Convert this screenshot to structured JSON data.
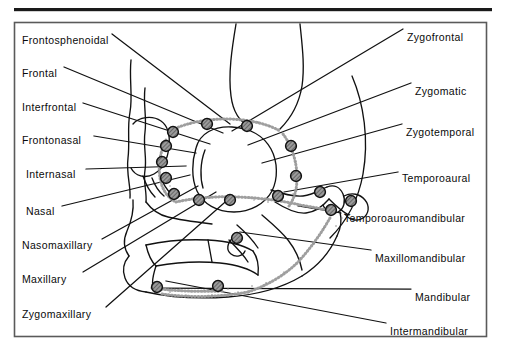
{
  "figure": {
    "type": "anatomical-diagram",
    "frame": {
      "border_color": "#555555",
      "background": "#ffffff"
    },
    "top_rule": {
      "color": "#1a1a1a"
    },
    "ink_color": "#111111",
    "suture_marker": {
      "shape": "circle",
      "fill": "#8c8c8c",
      "stroke": "#111111",
      "pattern": "hatched"
    },
    "labels_left": [
      {
        "id": "frontosphenoidal",
        "text": "Frontosphenoidal",
        "x": 22,
        "y": 34
      },
      {
        "id": "frontal",
        "text": "Frontal",
        "x": 22,
        "y": 67
      },
      {
        "id": "interfrontal",
        "text": "Interfrontal",
        "x": 22,
        "y": 101
      },
      {
        "id": "frontonasal",
        "text": "Frontonasal",
        "x": 22,
        "y": 134
      },
      {
        "id": "internasal",
        "text": "Internasal",
        "x": 26,
        "y": 168
      },
      {
        "id": "nasal",
        "text": "Nasal",
        "x": 26,
        "y": 205
      },
      {
        "id": "nasomaxillary",
        "text": "Nasomaxillary",
        "x": 22,
        "y": 239
      },
      {
        "id": "maxillary",
        "text": "Maxillary",
        "x": 22,
        "y": 273
      },
      {
        "id": "zygomaxillary",
        "text": "Zygomaxillary",
        "x": 22,
        "y": 308
      }
    ],
    "labels_right": [
      {
        "id": "zygofrontal",
        "text": "Zygofrontal",
        "x": 407,
        "y": 31
      },
      {
        "id": "zygomatic",
        "text": "Zygomatic",
        "x": 415,
        "y": 85
      },
      {
        "id": "zygotemporal",
        "text": "Zygotemporal",
        "x": 406,
        "y": 126
      },
      {
        "id": "temporoaural",
        "text": "Temporoaural",
        "x": 402,
        "y": 172
      },
      {
        "id": "temporoauromandibular",
        "text": "Temporoauromandibular",
        "x": 344,
        "y": 212
      },
      {
        "id": "maxillomandibular",
        "text": "Maxillomandibular",
        "x": 375,
        "y": 252
      },
      {
        "id": "mandibular",
        "text": "Mandibular",
        "x": 415,
        "y": 291
      },
      {
        "id": "intermandibular",
        "text": "Intermandibular",
        "x": 390,
        "y": 325
      }
    ]
  }
}
